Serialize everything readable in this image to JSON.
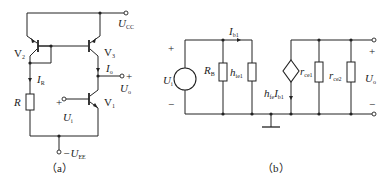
{
  "figure_a": {
    "caption": "（a）",
    "labels": {
      "ucc": "U",
      "ucc_sub": "CC",
      "uee": "−U",
      "uee_sub": "EE",
      "v1": "V",
      "v1_sub": "1",
      "v2": "V",
      "v2_sub": "2",
      "v3": "V",
      "v3_sub": "3",
      "ir": "I",
      "ir_sub": "R",
      "io": "I",
      "io_sub": "o",
      "r": "R",
      "ui": "U",
      "ui_sub": "i",
      "uo": "U",
      "uo_sub": "o",
      "plus_in": "+",
      "plus_out": "+"
    }
  },
  "figure_b": {
    "caption": "（b）",
    "labels": {
      "plus_left": "+",
      "minus_left": "−",
      "ui": "U",
      "ui_sub": "i",
      "rb": "R",
      "rb_sub": "B",
      "hie1": "h",
      "hie1_sub": "ie1",
      "ib1": "I",
      "ib1_sub": "b1",
      "hfe": "h",
      "hfe_sub": "fe",
      "hfe_i": "I",
      "hfe_i_sub": "b1",
      "rce1": "r",
      "rce1_sub": "ce1",
      "rce2": "r",
      "rce2_sub": "ce2",
      "uo": "U",
      "uo_sub": "o",
      "plus_right": "+",
      "minus_right": "−"
    }
  }
}
